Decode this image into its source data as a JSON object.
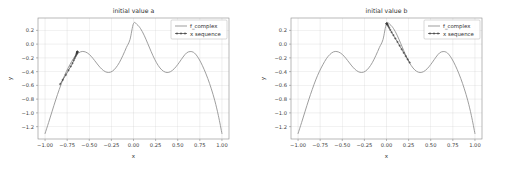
{
  "figure": {
    "background_color": "#ffffff",
    "width": 506,
    "height": 172,
    "panel_count": 2
  },
  "chart_data": [
    {
      "type": "line",
      "title": "initial value a",
      "xlabel": "x",
      "ylabel": "y",
      "xlim": [
        -1.08,
        1.08
      ],
      "ylim": [
        -1.38,
        0.38
      ],
      "grid": true,
      "legend_position": "upper right",
      "xticks": [
        -1.0,
        -0.75,
        -0.5,
        -0.25,
        0.0,
        0.25,
        0.5,
        0.75,
        1.0
      ],
      "xticklabels": [
        "-1.00",
        "-0.75",
        "-0.50",
        "-0.25",
        "0.00",
        "0.25",
        "0.50",
        "0.75",
        "1.00"
      ],
      "yticks": [
        0.2,
        0.0,
        -0.2,
        -0.4,
        -0.6,
        -0.8,
        -1.0,
        -1.2
      ],
      "yticklabels": [
        "0.2",
        "0.0",
        "-0.2",
        "-0.4",
        "-0.6",
        "-0.8",
        "-1.0",
        "-1.2"
      ],
      "series": [
        {
          "name": "f_complex",
          "style": "line",
          "color": "#8c8c8c",
          "x": [
            -1.0,
            -0.96,
            -0.92,
            -0.88,
            -0.84,
            -0.8,
            -0.76,
            -0.72,
            -0.68,
            -0.64,
            -0.6,
            -0.56,
            -0.52,
            -0.48,
            -0.44,
            -0.4,
            -0.36,
            -0.32,
            -0.28,
            -0.24,
            -0.2,
            -0.16,
            -0.12,
            -0.08,
            -0.04,
            0.0,
            0.04,
            0.08,
            0.12,
            0.16,
            0.2,
            0.24,
            0.28,
            0.32,
            0.36,
            0.4,
            0.44,
            0.48,
            0.52,
            0.56,
            0.6,
            0.64,
            0.68,
            0.72,
            0.76,
            0.8,
            0.84,
            0.88,
            0.92,
            0.96,
            1.0
          ],
          "y": [
            -1.3,
            -1.14,
            -0.975,
            -0.812,
            -0.66,
            -0.52,
            -0.4,
            -0.3,
            -0.212,
            -0.15,
            -0.113,
            -0.108,
            -0.13,
            -0.175,
            -0.238,
            -0.305,
            -0.362,
            -0.4,
            -0.412,
            -0.395,
            -0.345,
            -0.268,
            -0.165,
            -0.048,
            0.065,
            0.3,
            0.285,
            0.225,
            0.13,
            0.012,
            -0.11,
            -0.222,
            -0.312,
            -0.375,
            -0.408,
            -0.41,
            -0.382,
            -0.33,
            -0.262,
            -0.188,
            -0.128,
            -0.108,
            -0.12,
            -0.175,
            -0.262,
            -0.372,
            -0.5,
            -0.65,
            -0.825,
            -1.04,
            -1.3
          ]
        },
        {
          "name": "x sequence",
          "style": "line-markers",
          "color": "#3c3c3c",
          "marker": "plus",
          "x": [
            -0.83,
            -0.8,
            -0.765,
            -0.735,
            -0.71,
            -0.69,
            -0.675,
            -0.665,
            -0.656,
            -0.65,
            -0.645,
            -0.642,
            -0.64,
            -0.638,
            -0.637,
            -0.636,
            -0.635,
            -0.635,
            -0.634,
            -0.634
          ],
          "y": [
            -0.582,
            -0.52,
            -0.448,
            -0.38,
            -0.325,
            -0.278,
            -0.235,
            -0.205,
            -0.18,
            -0.162,
            -0.148,
            -0.137,
            -0.129,
            -0.123,
            -0.119,
            -0.116,
            -0.114,
            -0.113,
            -0.112,
            -0.112
          ]
        }
      ]
    },
    {
      "type": "line",
      "title": "initial value b",
      "xlabel": "x",
      "ylabel": "y",
      "xlim": [
        -1.08,
        1.08
      ],
      "ylim": [
        -1.38,
        0.38
      ],
      "grid": true,
      "legend_position": "upper right",
      "xticks": [
        -1.0,
        -0.75,
        -0.5,
        -0.25,
        0.0,
        0.25,
        0.5,
        0.75,
        1.0
      ],
      "xticklabels": [
        "-1.00",
        "-0.75",
        "-0.50",
        "-0.25",
        "0.00",
        "0.25",
        "0.50",
        "0.75",
        "1.00"
      ],
      "yticks": [
        0.2,
        0.0,
        -0.2,
        -0.4,
        -0.6,
        -0.8,
        -1.0,
        -1.2
      ],
      "yticklabels": [
        "0.2",
        "0.0",
        "-0.2",
        "-0.4",
        "-0.6",
        "-0.8",
        "-1.0",
        "-1.2"
      ],
      "series": [
        {
          "name": "f_complex",
          "style": "line",
          "color": "#8c8c8c",
          "x": [
            -1.0,
            -0.96,
            -0.92,
            -0.88,
            -0.84,
            -0.8,
            -0.76,
            -0.72,
            -0.68,
            -0.64,
            -0.6,
            -0.56,
            -0.52,
            -0.48,
            -0.44,
            -0.4,
            -0.36,
            -0.32,
            -0.28,
            -0.24,
            -0.2,
            -0.16,
            -0.12,
            -0.08,
            -0.04,
            0.0,
            0.04,
            0.08,
            0.12,
            0.16,
            0.2,
            0.24,
            0.28,
            0.32,
            0.36,
            0.4,
            0.44,
            0.48,
            0.52,
            0.56,
            0.6,
            0.64,
            0.68,
            0.72,
            0.76,
            0.8,
            0.84,
            0.88,
            0.92,
            0.96,
            1.0
          ],
          "y": [
            -1.3,
            -1.14,
            -0.975,
            -0.812,
            -0.66,
            -0.52,
            -0.4,
            -0.3,
            -0.212,
            -0.15,
            -0.113,
            -0.108,
            -0.13,
            -0.175,
            -0.238,
            -0.305,
            -0.362,
            -0.4,
            -0.412,
            -0.395,
            -0.345,
            -0.268,
            -0.165,
            -0.048,
            0.065,
            0.3,
            0.285,
            0.225,
            0.13,
            0.012,
            -0.11,
            -0.222,
            -0.312,
            -0.375,
            -0.408,
            -0.41,
            -0.382,
            -0.33,
            -0.262,
            -0.188,
            -0.128,
            -0.108,
            -0.12,
            -0.175,
            -0.262,
            -0.372,
            -0.5,
            -0.65,
            -0.825,
            -1.04,
            -1.3
          ]
        },
        {
          "name": "x sequence",
          "style": "line-markers",
          "color": "#3c3c3c",
          "marker": "plus",
          "x": [
            0.262,
            0.24,
            0.218,
            0.195,
            0.172,
            0.148,
            0.124,
            0.1,
            0.078,
            0.058,
            0.042,
            0.03,
            0.021,
            0.014,
            0.009,
            0.006,
            0.004,
            0.002,
            0.001,
            0.0
          ],
          "y": [
            -0.268,
            -0.222,
            -0.175,
            -0.126,
            -0.075,
            -0.022,
            0.032,
            0.082,
            0.13,
            0.172,
            0.208,
            0.238,
            0.26,
            0.276,
            0.286,
            0.292,
            0.296,
            0.298,
            0.299,
            0.3
          ]
        }
      ]
    }
  ],
  "panels": [
    {
      "title": "initial value a",
      "xlabel": "x",
      "ylabel": "y",
      "xticklabels": [
        "-1.00",
        "-0.75",
        "-0.50",
        "-0.25",
        "0.00",
        "0.25",
        "0.50",
        "0.75",
        "1.00"
      ],
      "yticklabels": [
        "0.2",
        "0.0",
        "-0.2",
        "-0.4",
        "-0.6",
        "-0.8",
        "-1.0",
        "-1.2"
      ],
      "legend": [
        {
          "label": "f_complex",
          "style": "line"
        },
        {
          "label": "x sequence",
          "style": "line-markers"
        }
      ]
    },
    {
      "title": "initial value b",
      "xlabel": "x",
      "ylabel": "y",
      "xticklabels": [
        "-1.00",
        "-0.75",
        "-0.50",
        "-0.25",
        "0.00",
        "0.25",
        "0.50",
        "0.75",
        "1.00"
      ],
      "yticklabels": [
        "0.2",
        "0.0",
        "-0.2",
        "-0.4",
        "-0.6",
        "-0.8",
        "-1.0",
        "-1.2"
      ],
      "legend": [
        {
          "label": "f_complex",
          "style": "line"
        },
        {
          "label": "x sequence",
          "style": "line-markers"
        }
      ]
    }
  ]
}
